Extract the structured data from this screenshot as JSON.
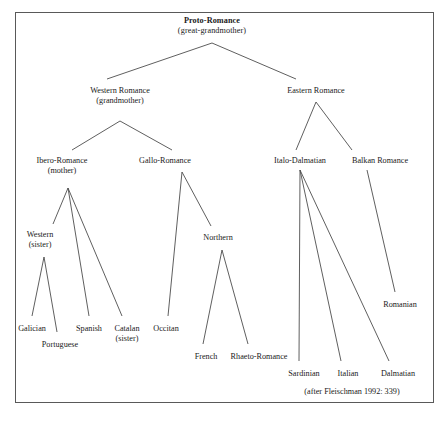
{
  "figure": {
    "credit": "(after Fleischman 1992: 339)",
    "credit_x": 352,
    "credit_y": 387,
    "frame_color": "#595959",
    "line_color": "#4d4d4d",
    "text_color": "#1a1a1a",
    "background": "#ffffff"
  },
  "nodes": [
    {
      "id": "proto-romance",
      "label": "Proto-Romance",
      "sub": "(great-grandmother)",
      "bold": true,
      "x": 212,
      "y": 16,
      "anchor_x": 212,
      "anchor_y": 43
    },
    {
      "id": "western-romance",
      "label": "Western Romance",
      "sub": "(grandmother)",
      "bold": false,
      "x": 120,
      "y": 86,
      "anchor_x": 120,
      "anchor_y": 121
    },
    {
      "id": "eastern-romance",
      "label": "Eastern Romance",
      "sub": "",
      "bold": false,
      "x": 316,
      "y": 86,
      "anchor_x": 316,
      "anchor_y": 102
    },
    {
      "id": "ibero-romance",
      "label": "Ibero-Romance",
      "sub": "(mother)",
      "bold": false,
      "x": 62,
      "y": 156,
      "anchor_x": 68,
      "anchor_y": 188
    },
    {
      "id": "gallo-romance",
      "label": "Gallo-Romance",
      "sub": "",
      "bold": false,
      "x": 165,
      "y": 156,
      "anchor_x": 182,
      "anchor_y": 172
    },
    {
      "id": "italo-dalmatian",
      "label": "Italo-Dalmatian",
      "sub": "",
      "bold": false,
      "x": 300,
      "y": 156,
      "anchor_x": 300,
      "anchor_y": 170
    },
    {
      "id": "balkan-romance",
      "label": "Balkan Romance",
      "sub": "",
      "bold": false,
      "x": 380,
      "y": 156,
      "anchor_x": 367,
      "anchor_y": 170
    },
    {
      "id": "western-sister",
      "label": "Western",
      "sub": "(sister)",
      "bold": false,
      "x": 40,
      "y": 230,
      "anchor_x": 44,
      "anchor_y": 257
    },
    {
      "id": "northern",
      "label": "Northern",
      "sub": "",
      "bold": false,
      "x": 218,
      "y": 233,
      "anchor_x": 222,
      "anchor_y": 250
    },
    {
      "id": "galician",
      "label": "Galician",
      "sub": "",
      "bold": false,
      "x": 32,
      "y": 324,
      "anchor_x": 32,
      "anchor_y": 316
    },
    {
      "id": "portuguese",
      "label": "Portuguese",
      "sub": "",
      "bold": false,
      "x": 60,
      "y": 340,
      "anchor_x": 57,
      "anchor_y": 332
    },
    {
      "id": "spanish",
      "label": "Spanish",
      "sub": "",
      "bold": false,
      "x": 89,
      "y": 324,
      "anchor_x": 89,
      "anchor_y": 316
    },
    {
      "id": "catalan",
      "label": "Catalan",
      "sub": "(sister)",
      "bold": false,
      "x": 127,
      "y": 324,
      "anchor_x": 122,
      "anchor_y": 316
    },
    {
      "id": "occitan",
      "label": "Occitan",
      "sub": "",
      "bold": false,
      "x": 166,
      "y": 324,
      "anchor_x": 168,
      "anchor_y": 316
    },
    {
      "id": "french",
      "label": "French",
      "sub": "",
      "bold": false,
      "x": 206,
      "y": 352,
      "anchor_x": 203,
      "anchor_y": 344
    },
    {
      "id": "rhaeto-romance",
      "label": "Rhaeto-Romance",
      "sub": "",
      "bold": false,
      "x": 259,
      "y": 352,
      "anchor_x": 248,
      "anchor_y": 344
    },
    {
      "id": "sardinian",
      "label": "Sardinian",
      "sub": "",
      "bold": false,
      "x": 304,
      "y": 369,
      "anchor_x": 299,
      "anchor_y": 361
    },
    {
      "id": "italian",
      "label": "Italian",
      "sub": "",
      "bold": false,
      "x": 348,
      "y": 369,
      "anchor_x": 341,
      "anchor_y": 361
    },
    {
      "id": "dalmatian",
      "label": "Dalmatian",
      "sub": "",
      "bold": false,
      "x": 398,
      "y": 369,
      "anchor_x": 389,
      "anchor_y": 361
    },
    {
      "id": "romanian",
      "label": "Romanian",
      "sub": "",
      "bold": false,
      "x": 400,
      "y": 300,
      "anchor_x": 395,
      "anchor_y": 292
    }
  ],
  "edges": [
    {
      "from": "proto-romance",
      "to": "western-romance",
      "x1": 212,
      "y1": 43,
      "x2": 107,
      "y2": 79
    },
    {
      "from": "proto-romance",
      "to": "eastern-romance",
      "x1": 212,
      "y1": 43,
      "x2": 296,
      "y2": 79
    },
    {
      "from": "western-romance",
      "to": "ibero-romance",
      "x1": 120,
      "y1": 121,
      "x2": 72,
      "y2": 150
    },
    {
      "from": "western-romance",
      "to": "gallo-romance",
      "x1": 120,
      "y1": 121,
      "x2": 172,
      "y2": 150
    },
    {
      "from": "eastern-romance",
      "to": "italo-dalmatian",
      "x1": 316,
      "y1": 102,
      "x2": 296,
      "y2": 150
    },
    {
      "from": "eastern-romance",
      "to": "balkan-romance",
      "x1": 316,
      "y1": 102,
      "x2": 352,
      "y2": 150
    },
    {
      "from": "ibero-romance",
      "to": "western-sister",
      "x1": 68,
      "y1": 188,
      "x2": 53,
      "y2": 224
    },
    {
      "from": "ibero-romance",
      "to": "spanish",
      "x1": 68,
      "y1": 188,
      "x2": 89,
      "y2": 316
    },
    {
      "from": "ibero-romance",
      "to": "catalan",
      "x1": 68,
      "y1": 188,
      "x2": 122,
      "y2": 316
    },
    {
      "from": "western-sister",
      "to": "galician",
      "x1": 44,
      "y1": 257,
      "x2": 32,
      "y2": 316
    },
    {
      "from": "western-sister",
      "to": "portuguese",
      "x1": 44,
      "y1": 257,
      "x2": 57,
      "y2": 332
    },
    {
      "from": "gallo-romance",
      "to": "occitan",
      "x1": 182,
      "y1": 172,
      "x2": 168,
      "y2": 316
    },
    {
      "from": "gallo-romance",
      "to": "northern",
      "x1": 182,
      "y1": 172,
      "x2": 211,
      "y2": 226
    },
    {
      "from": "northern",
      "to": "french",
      "x1": 222,
      "y1": 250,
      "x2": 203,
      "y2": 344
    },
    {
      "from": "northern",
      "to": "rhaeto-romance",
      "x1": 222,
      "y1": 250,
      "x2": 248,
      "y2": 344
    },
    {
      "from": "italo-dalmatian",
      "to": "sardinian",
      "x1": 300,
      "y1": 170,
      "x2": 299,
      "y2": 361
    },
    {
      "from": "italo-dalmatian",
      "to": "italian",
      "x1": 300,
      "y1": 170,
      "x2": 341,
      "y2": 361
    },
    {
      "from": "italo-dalmatian",
      "to": "dalmatian",
      "x1": 300,
      "y1": 170,
      "x2": 389,
      "y2": 361
    },
    {
      "from": "balkan-romance",
      "to": "romanian",
      "x1": 367,
      "y1": 170,
      "x2": 395,
      "y2": 292
    }
  ]
}
